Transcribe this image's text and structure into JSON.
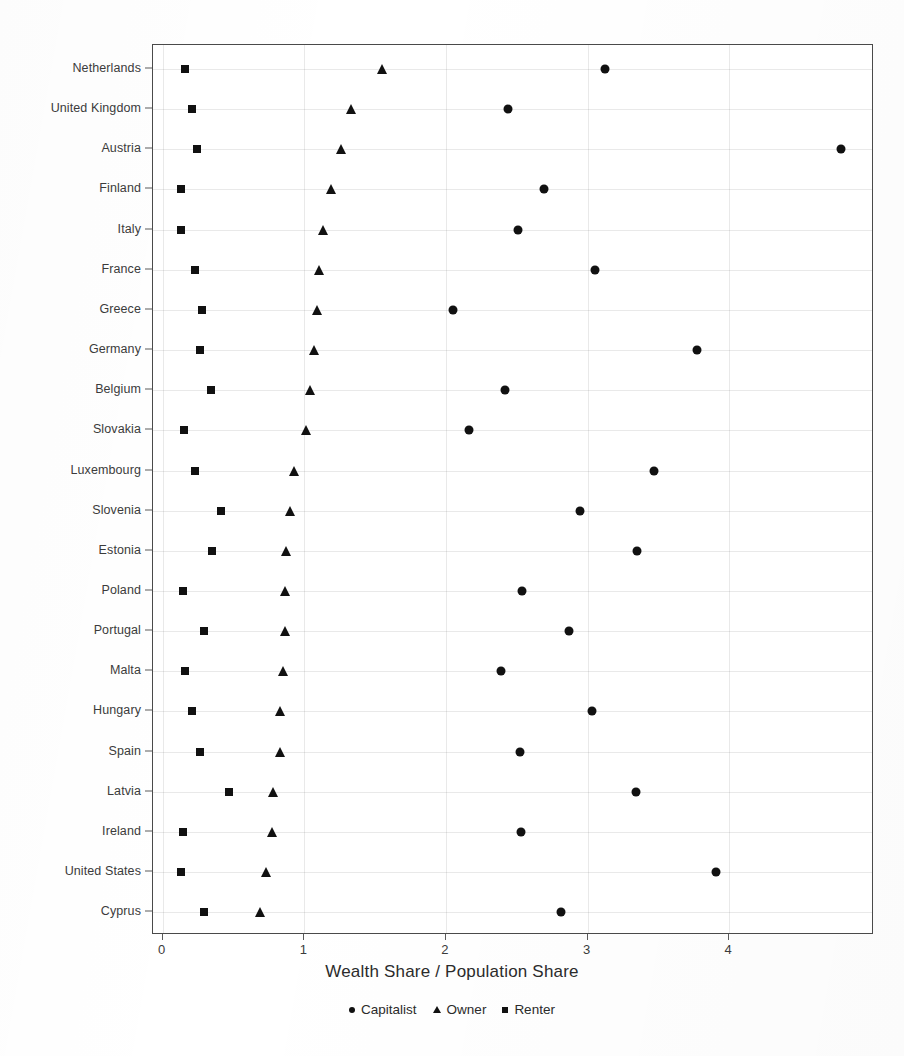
{
  "chart_data": {
    "type": "scatter",
    "title": "",
    "xlabel": "Wealth Share / Population Share",
    "ylabel": "",
    "xlim": [
      -0.11,
      5.0
    ],
    "xticks": [
      0,
      1,
      2,
      3,
      4
    ],
    "xticklabels": [
      "0",
      "1",
      "2",
      "3",
      "4"
    ],
    "grid": true,
    "legend_position": "below-axis-centered",
    "legend": [
      "Capitalist",
      "Owner",
      "Renter"
    ],
    "categories": [
      "Netherlands",
      "United Kingdom",
      "Austria",
      "Finland",
      "Italy",
      "France",
      "Greece",
      "Germany",
      "Belgium",
      "Slovakia",
      "Luxembourg",
      "Slovenia",
      "Estonia",
      "Poland",
      "Portugal",
      "Malta",
      "Hungary",
      "Spain",
      "Latvia",
      "Ireland",
      "United States",
      "Cyprus"
    ],
    "series": [
      {
        "name": "Capitalist",
        "marker": "circle",
        "values": [
          3.12,
          2.44,
          4.79,
          2.69,
          2.51,
          3.05,
          2.05,
          3.77,
          2.42,
          2.16,
          3.47,
          2.95,
          3.35,
          2.54,
          2.87,
          2.39,
          3.03,
          2.52,
          3.34,
          2.53,
          3.91,
          2.81
        ]
      },
      {
        "name": "Owner",
        "marker": "triangle",
        "values": [
          1.55,
          1.33,
          1.26,
          1.19,
          1.13,
          1.1,
          1.09,
          1.07,
          1.04,
          1.01,
          0.93,
          0.9,
          0.87,
          0.86,
          0.86,
          0.85,
          0.83,
          0.83,
          0.78,
          0.77,
          0.73,
          0.69
        ]
      },
      {
        "name": "Renter",
        "marker": "square",
        "values": [
          0.16,
          0.21,
          0.24,
          0.13,
          0.13,
          0.23,
          0.28,
          0.26,
          0.34,
          0.15,
          0.23,
          0.41,
          0.35,
          0.14,
          0.29,
          0.16,
          0.21,
          0.26,
          0.47,
          0.14,
          0.13,
          0.29
        ]
      }
    ],
    "colors": {
      "marker": "#111111",
      "axis": "#4a4a4a",
      "grid": "#bdbdbd",
      "text": "#3b3b3b",
      "background": "#ffffff"
    }
  },
  "caption": ""
}
